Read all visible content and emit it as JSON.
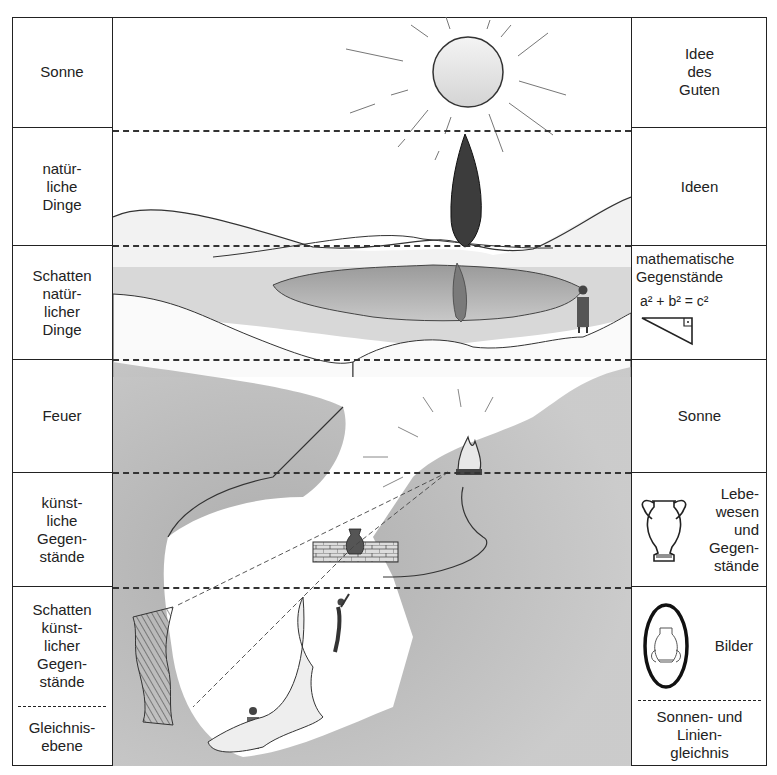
{
  "left_column": {
    "cells": [
      {
        "label": "Sonne"
      },
      {
        "label": "natür-\nliche\nDinge"
      },
      {
        "label": "Schatten\nnatür-\nlicher\nDinge"
      },
      {
        "label": "Feuer"
      },
      {
        "label": "künst-\nliche\nGegen-\nstände"
      },
      {
        "label": "Schatten\nkünst-\nlicher\nGegen-\nstände"
      }
    ],
    "footer": {
      "label": "Gleichnis-\nebene"
    }
  },
  "right_column": {
    "cells": [
      {
        "label": "Idee\ndes\nGuten"
      },
      {
        "label": "Ideen"
      },
      {
        "label": "mathematische\nGegenstände",
        "formula": "a² + b² = c²",
        "icon": "right-triangle-icon"
      },
      {
        "label": "Sonne"
      },
      {
        "label": "Lebe-\nwesen\nund\nGegen-\nstände",
        "icon": "amphora-icon"
      },
      {
        "label": "Bilder",
        "icon": "framed-amphora-image-icon"
      }
    ],
    "footer": {
      "label": "Sonnen- und\nLinien-\ngleichnis"
    }
  },
  "scene": {
    "elements": [
      "sun",
      "cypress-tree",
      "tree-reflection-pond",
      "philosopher-figure",
      "hills",
      "cave",
      "fire",
      "wall",
      "amphora-on-wall",
      "climbing-prisoner",
      "chained-prisoner",
      "shadow-on-cave-wall"
    ]
  },
  "colors": {
    "line": "#222222",
    "shade": "#8a8a8a",
    "background": "#ffffff"
  }
}
